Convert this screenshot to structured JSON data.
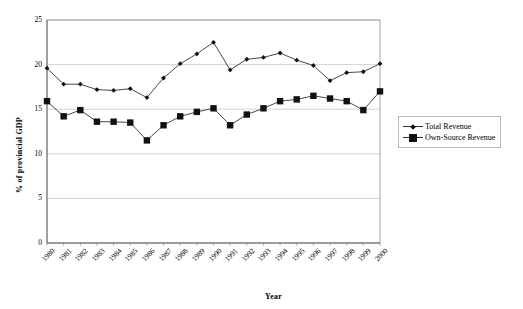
{
  "chart_data": {
    "type": "line",
    "title": "",
    "xlabel": "Year",
    "ylabel": "% of provincial GDP",
    "ylim": [
      0,
      25
    ],
    "ytick_step": 5,
    "yticks": [
      "0",
      "5",
      "10",
      "15",
      "20",
      "25"
    ],
    "grid": true,
    "legend_position": "right",
    "categories": [
      "1980",
      "1981",
      "1982",
      "1983",
      "1984",
      "1985",
      "1986",
      "1987",
      "1988",
      "1989",
      "1990",
      "1991",
      "1992",
      "1993",
      "1994",
      "1995",
      "1996",
      "1997",
      "1998",
      "1999",
      "2000"
    ],
    "series": [
      {
        "name": "Total Revenue",
        "marker": "diamond",
        "color": "#111111",
        "values": [
          19.6,
          17.8,
          17.8,
          17.2,
          17.1,
          17.3,
          16.3,
          18.5,
          20.1,
          21.2,
          22.5,
          19.4,
          20.6,
          20.8,
          21.3,
          20.5,
          19.9,
          18.2,
          19.1,
          19.2,
          20.1
        ]
      },
      {
        "name": "Own-Source Revenue",
        "marker": "square",
        "color": "#111111",
        "values": [
          15.9,
          14.2,
          14.9,
          13.6,
          13.6,
          13.5,
          11.5,
          13.2,
          14.2,
          14.7,
          15.1,
          13.2,
          14.4,
          15.1,
          15.9,
          16.1,
          16.5,
          16.2,
          15.9,
          14.9,
          17.0
        ]
      }
    ]
  },
  "legend": {
    "items": [
      {
        "label": "Total Revenue"
      },
      {
        "label": "Own-Source Revenue"
      }
    ]
  },
  "axes": {
    "x_title": "Year",
    "y_title": "% of provincial GDP"
  }
}
